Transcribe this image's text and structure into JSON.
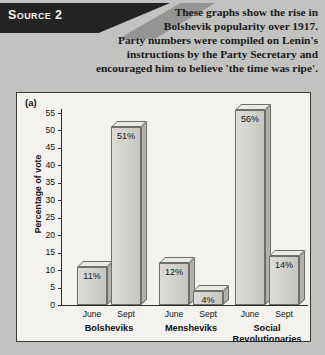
{
  "source": {
    "banner_label": "Source 2",
    "intro_lines": [
      "These graphs show the rise in",
      "Bolshevik popularity over 1917.",
      "Party numbers were compiled on Lenin's",
      "instructions by the Party Secretary and",
      "encouraged him to believe 'the time was ripe'."
    ]
  },
  "panel": {
    "tag": "(a)"
  },
  "chart_data": {
    "type": "bar",
    "title": "",
    "xlabel": "",
    "ylabel": "Percentage of vote",
    "ylim": [
      0,
      55
    ],
    "yticks": [
      0,
      5,
      10,
      15,
      20,
      25,
      30,
      35,
      40,
      45,
      50,
      55
    ],
    "ytick_labels": [
      "0",
      "5",
      "10",
      "15",
      "20",
      "25",
      "30",
      "35",
      "40",
      "45",
      "50",
      "55"
    ],
    "grid": false,
    "legend": "none",
    "categories": [
      "Bolsheviks",
      "Mensheviks",
      "Social Revolutionaries"
    ],
    "category_labels": [
      [
        "Bolsheviks"
      ],
      [
        "Mensheviks"
      ],
      [
        "Social",
        "Revolutionaries"
      ]
    ],
    "x": [
      "June",
      "Sept"
    ],
    "series": [
      {
        "name": "June",
        "values": [
          11,
          12,
          56
        ],
        "value_labels": [
          "11%",
          "12%",
          "56%"
        ]
      },
      {
        "name": "Sept",
        "values": [
          51,
          4,
          14
        ],
        "value_labels": [
          "51%",
          "4%",
          "14%"
        ]
      }
    ],
    "bars": [
      {
        "group": "Bolsheviks",
        "period": "June",
        "value": 11,
        "label": "11%"
      },
      {
        "group": "Bolsheviks",
        "period": "Sept",
        "value": 51,
        "label": "51%"
      },
      {
        "group": "Mensheviks",
        "period": "June",
        "value": 12,
        "label": "12%"
      },
      {
        "group": "Mensheviks",
        "period": "Sept",
        "value": 4,
        "label": "4%"
      },
      {
        "group": "Social Revolutionaries",
        "period": "June",
        "value": 56,
        "label": "56%"
      },
      {
        "group": "Social Revolutionaries",
        "period": "Sept",
        "value": 14,
        "label": "14%"
      }
    ]
  },
  "colors": {
    "page_background": "#c2c2c0",
    "banner": "#232323",
    "panel_background": "#f3f2ef",
    "panel_border": "#3a3a38",
    "bar_front": "#d2d1cc",
    "bar_top": "#eceae5",
    "bar_side": "#b2b1ac",
    "text": "#141414"
  }
}
